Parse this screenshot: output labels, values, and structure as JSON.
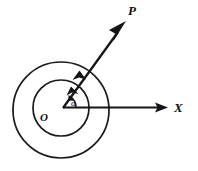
{
  "figure": {
    "background_color": "#ffffff",
    "stroke_color": "#151515",
    "labels": {
      "vector_p": "P",
      "axis_x": "X",
      "origin": "O",
      "angle": "α"
    },
    "geometry": {
      "origin_x": 63,
      "origin_y": 108,
      "outer_circle": {
        "center_x": 61,
        "center_y": 110,
        "radius": 48,
        "name": "outer-circle"
      },
      "inner_circle": {
        "center_x": 61,
        "center_y": 108,
        "radius": 28,
        "name": "inner-circle"
      },
      "x_axis": {
        "start_x": 63,
        "start_y": 107,
        "end_x": 168,
        "end_y": 107,
        "arrow_tip_x": 168,
        "arrow_tip_y": 107
      },
      "p_vector": {
        "start_x": 63,
        "start_y": 108,
        "end_x": 126,
        "end_y": 21,
        "angle_degrees": 54
      },
      "angle_arc": {
        "radius": 13,
        "from_degrees": 0,
        "to_degrees": 54
      }
    },
    "arc_arrowheads": [
      {
        "name": "outer-arc-arrowhead",
        "x": 79,
        "y": 72
      },
      {
        "name": "inner-arc-arrowhead",
        "x": 72,
        "y": 88
      },
      {
        "name": "angle-arc-arrowhead",
        "x": 69,
        "y": 96
      }
    ]
  }
}
